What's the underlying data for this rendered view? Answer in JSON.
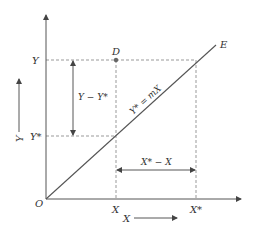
{
  "diagram": {
    "labels": {
      "origin": "O",
      "y_tick": "Y",
      "y_star_tick": "Y*",
      "x_tick": "X",
      "x_star_tick": "X*",
      "point_d": "D",
      "line_end": "E",
      "line_equation": "Y* = mX",
      "y_gap": "Y − Y*",
      "x_gap": "X* − X",
      "y_direction": "Y",
      "x_direction": "X"
    },
    "colors": {
      "axis": "#555555",
      "dashed": "#999999",
      "line": "#555555",
      "point": "#666666"
    }
  }
}
